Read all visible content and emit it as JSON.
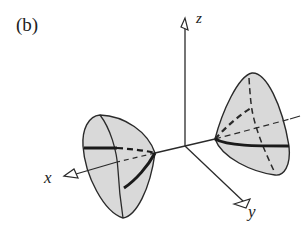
{
  "figure": {
    "panel_label": "(b)",
    "axes": {
      "x_label": "x",
      "y_label": "y",
      "z_label": "z"
    },
    "surface": "hyperboloid of two sheets",
    "colors": {
      "fill": "#d9d9d9",
      "stroke": "#2a2a2a",
      "background": "#ffffff"
    }
  }
}
